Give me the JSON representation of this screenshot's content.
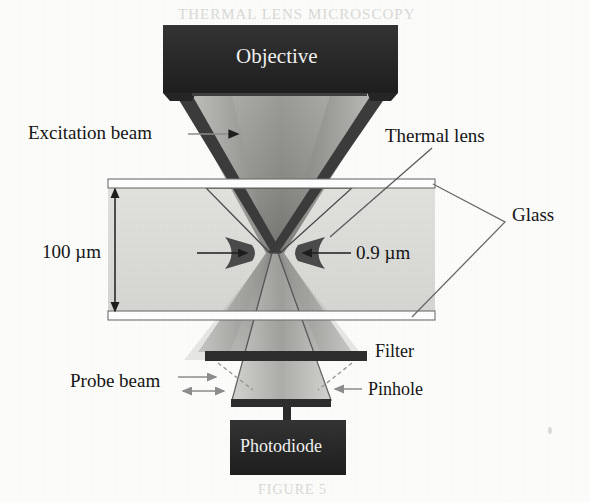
{
  "figure": {
    "kind": "optical-schematic",
    "title_ghost_top": "THERMAL LENS MICROSCOPY",
    "title_ghost_bottom": "FIGURE 5",
    "background_color": "#fdfdfc"
  },
  "colors": {
    "block_dark": "#2b2b2b",
    "block_text": "#f2f2f2",
    "beam_edge": "#3a3a3a",
    "beam_fill_dark": "#8a8a8a",
    "beam_fill_light": "#c9c9c6",
    "liquid_fill": "#dcdcd8",
    "glass_outline": "#6f6f6f",
    "glass_fill": "#ffffff",
    "leader_line": "#5b5b5b",
    "arrow_gray": "#8d8d8d",
    "label_text": "#151515"
  },
  "components": [
    {
      "id": "objective",
      "label": "Objective",
      "type": "block",
      "x": 163,
      "y": 25,
      "w": 235,
      "h": 68,
      "label_x": 236,
      "label_y": 46,
      "font_size": 21
    },
    {
      "id": "photodiode",
      "label": "Photodiode",
      "type": "block",
      "x": 230,
      "y": 420,
      "w": 116,
      "h": 55,
      "label_x": 240,
      "label_y": 437,
      "font_size": 18
    },
    {
      "id": "filter",
      "label": "Filter",
      "type": "bar",
      "x": 205,
      "y": 351,
      "w": 162,
      "h": 10,
      "label_x": 375,
      "label_y": 343,
      "font_size": 18
    },
    {
      "id": "pinhole",
      "label": "Pinhole",
      "type": "bar",
      "x": 231,
      "y": 399,
      "w": 100,
      "h": 8,
      "label_x": 368,
      "label_y": 382,
      "font_size": 18
    },
    {
      "id": "glass-top",
      "label": "",
      "type": "slide",
      "x": 108,
      "y": 179,
      "w": 327,
      "h": 9
    },
    {
      "id": "glass-bottom",
      "label": "",
      "type": "slide",
      "x": 108,
      "y": 311,
      "w": 327,
      "h": 9
    }
  ],
  "annotations": [
    {
      "id": "excitation-beam",
      "label": "Excitation beam",
      "x": 28,
      "y": 123,
      "font_size": 19,
      "arrow": "right-into-cone"
    },
    {
      "id": "thermal-lens",
      "label": "Thermal lens",
      "x": 385,
      "y": 126,
      "font_size": 19,
      "arrow": "leader-down-left"
    },
    {
      "id": "glass",
      "label": "Glass",
      "x": 512,
      "y": 206,
      "font_size": 19,
      "arrow": "bracket"
    },
    {
      "id": "probe-beam",
      "label": "Probe beam",
      "x": 70,
      "y": 372,
      "font_size": 19,
      "arrow": "two-right-arrows"
    }
  ],
  "dimensions": [
    {
      "id": "sample-thickness",
      "value": "100 µm",
      "label_x": 42,
      "label_y": 243,
      "font_size": 19,
      "arrow_x": 115,
      "arrow_y1": 188,
      "arrow_y2": 312,
      "orientation": "vertical-double"
    },
    {
      "id": "beam-waist",
      "value": "0.9 µm",
      "label_x": 355,
      "label_y": 244,
      "font_size": 19,
      "arrow_left_x1": 197,
      "arrow_left_x2": 248,
      "arrow_right_x1": 350,
      "arrow_right_x2": 302,
      "arrow_y": 253,
      "orientation": "horizontal-inward-pair"
    }
  ],
  "beams": {
    "excitation": {
      "top_left_x": 178,
      "top_right_x": 385,
      "top_y": 95,
      "waist_x": 275,
      "waist_y": 253,
      "waist_half_width": 9,
      "bottom_left_x": 215,
      "bottom_right_x": 345,
      "bottom_y": 352
    },
    "probe": {
      "top_left_x": 205,
      "top_right_x": 352,
      "top_y": 188,
      "waist_y": 253,
      "bottom_left_x": 232,
      "bottom_right_x": 331,
      "bottom_y": 400
    }
  }
}
